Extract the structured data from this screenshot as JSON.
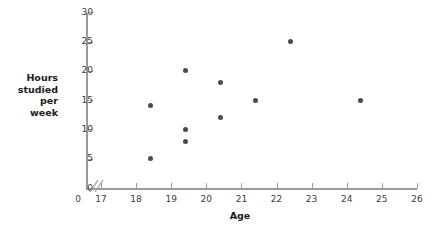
{
  "chart_data": {
    "type": "scatter",
    "title": "",
    "xlabel": "Age",
    "ylabel": "Hours studied per week",
    "ylabel_lines": [
      "Hours",
      "studied",
      "per",
      "week"
    ],
    "xlim": [
      17,
      26
    ],
    "ylim": [
      0,
      30
    ],
    "xticks": [
      17,
      18,
      19,
      20,
      21,
      22,
      23,
      24,
      25,
      26
    ],
    "yticks": [
      0,
      5,
      10,
      15,
      20,
      25,
      30
    ],
    "xtick_labels": [
      "17",
      "18",
      "19",
      "20",
      "21",
      "22",
      "23",
      "24",
      "25",
      "26"
    ],
    "ytick_labels": [
      "0",
      "5",
      "10",
      "15",
      "20",
      "25",
      "30"
    ],
    "origin_label": "0",
    "axis_break": true,
    "grid": false,
    "legend": null,
    "point_color": "#4a4a4c",
    "axis_color": "#9a9a9a",
    "points": [
      {
        "x": 18.4,
        "y": 14
      },
      {
        "x": 18.4,
        "y": 5
      },
      {
        "x": 19.4,
        "y": 20
      },
      {
        "x": 19.4,
        "y": 10
      },
      {
        "x": 19.4,
        "y": 8
      },
      {
        "x": 20.4,
        "y": 18
      },
      {
        "x": 20.4,
        "y": 12
      },
      {
        "x": 21.4,
        "y": 15
      },
      {
        "x": 22.4,
        "y": 25
      },
      {
        "x": 24.4,
        "y": 15
      }
    ]
  }
}
